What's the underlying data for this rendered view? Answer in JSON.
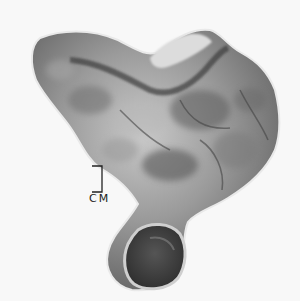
{
  "image": {
    "subject": "gross specimen photograph",
    "scale_bar": {
      "label": "CM"
    },
    "colors": {
      "background": "#f8f8f8",
      "tissue_light": "#c8c8c8",
      "tissue_mid": "#8a8a8a",
      "tissue_dark": "#3a3a3a"
    }
  }
}
